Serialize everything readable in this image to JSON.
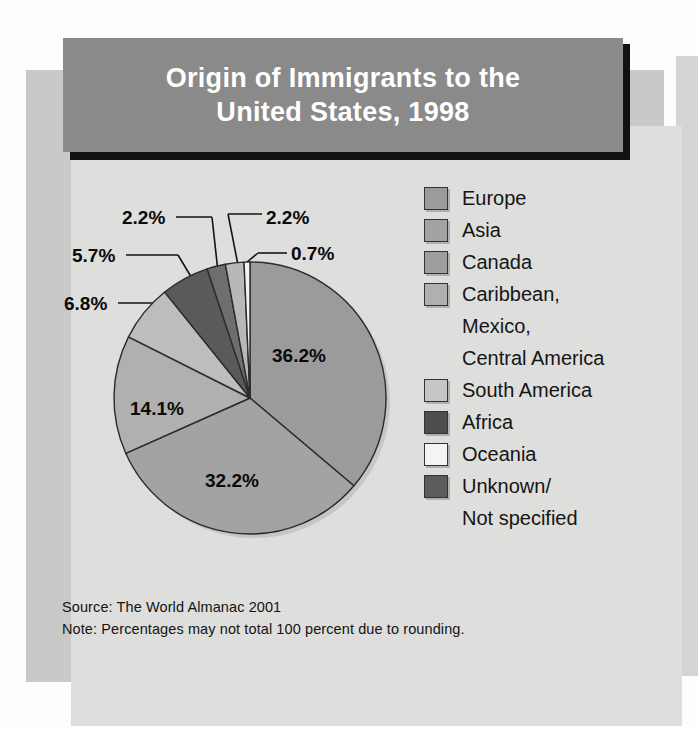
{
  "chart_data": {
    "type": "pie",
    "title": "Origin of Immigrants to the\nUnited States, 1998",
    "title_line1": "Origin of Immigrants to the",
    "title_line2": "United States, 1998",
    "categories": [
      "Europe",
      "Asia",
      "Caribbean, Mexico, Central America",
      "South America",
      "Africa",
      "Unknown/ Not specified",
      "Canada",
      "Oceania"
    ],
    "values": [
      36.2,
      32.2,
      14.1,
      6.8,
      5.7,
      2.2,
      2.2,
      0.7
    ],
    "value_labels": [
      "36.2%",
      "32.2%",
      "14.1%",
      "6.8%",
      "5.7%",
      "2.2%",
      "2.2%",
      "0.7%"
    ],
    "colors": [
      "#9b9b9b",
      "#a3a3a3",
      "#b0b0b0",
      "#bdbdbd",
      "#5a5a5a",
      "#6e6e6e",
      "#b8b8b8",
      "#f2f2f2"
    ],
    "start_angle_deg": 0,
    "direction": "clockwise",
    "legend_position": "right",
    "grid": false,
    "xlabel": "",
    "ylabel": "",
    "units": "percent",
    "note": "Percentages may not total 100 percent due to rounding.",
    "source": "The World Almanac 2001"
  },
  "header": {
    "title_line1": "Origin of Immigrants to the",
    "title_line2": "United States, 1998"
  },
  "legend": {
    "items": [
      {
        "label": "Europe",
        "color": "#9b9b9b",
        "has_swatch": true
      },
      {
        "label": "Asia",
        "color": "#a3a3a3",
        "has_swatch": true
      },
      {
        "label": "Canada",
        "color": "#9e9e9e",
        "has_swatch": true
      },
      {
        "label": "Caribbean,",
        "color": "#b0b0b0",
        "has_swatch": true
      },
      {
        "label": "Mexico,",
        "color": "",
        "has_swatch": false
      },
      {
        "label": "Central America",
        "color": "",
        "has_swatch": false
      },
      {
        "label": "South America",
        "color": "#c6c6c6",
        "has_swatch": true
      },
      {
        "label": "Africa",
        "color": "#4e4e4e",
        "has_swatch": true
      },
      {
        "label": "Oceania",
        "color": "#f4f4f4",
        "has_swatch": true
      },
      {
        "label": "Unknown/",
        "color": "#5c5c5c",
        "has_swatch": true
      },
      {
        "label": "Not specified",
        "color": "",
        "has_swatch": false
      }
    ]
  },
  "pie_labels": {
    "inside": [
      {
        "text": "36.2%",
        "left": "272px",
        "top": "345px"
      },
      {
        "text": "32.2%",
        "left": "205px",
        "top": "470px"
      },
      {
        "text": "14.1%",
        "left": "130px",
        "top": "398px"
      }
    ],
    "callouts": [
      {
        "text": "6.8%",
        "left": "64px",
        "top": "293px"
      },
      {
        "text": "5.7%",
        "left": "72px",
        "top": "245px"
      },
      {
        "text": "2.2%",
        "left": "122px",
        "top": "207px"
      },
      {
        "text": "2.2%",
        "left": "266px",
        "top": "207px"
      },
      {
        "text": "0.7%",
        "left": "291px",
        "top": "243px"
      }
    ]
  },
  "footnotes": {
    "source": "Source: The World Almanac 2001",
    "note": "Note: Percentages may not total 100 percent due to rounding."
  }
}
